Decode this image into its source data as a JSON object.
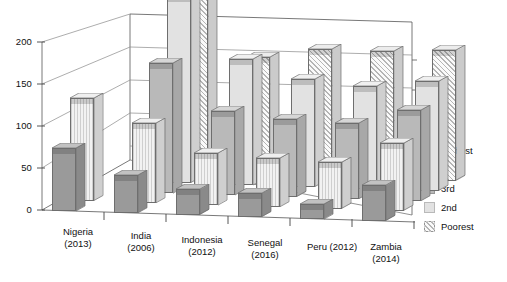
{
  "chart_data": {
    "type": "bar",
    "title": "",
    "xlabel": "",
    "ylabel": "",
    "ylim": [
      0,
      225
    ],
    "yticks": [
      0,
      50,
      100,
      150,
      200
    ],
    "grid": true,
    "threeD": true,
    "legend_position": "right",
    "categories": [
      "Nigeria\n(2013)",
      "India\n(2006)",
      "Indonesia\n(2012)",
      "Senegal\n(2016)",
      "Peru (2012)",
      "Zambia\n(2014)"
    ],
    "category_labels": [
      {
        "name": "Nigeria",
        "year": "(2013)"
      },
      {
        "name": "India",
        "year": "(2006)"
      },
      {
        "name": "Indonesia",
        "year": "(2012)"
      },
      {
        "name": "Senegal",
        "year": "(2016)"
      },
      {
        "name": "Peru (2012)",
        "year": ""
      },
      {
        "name": "Zambia",
        "year": "(2014)"
      }
    ],
    "series": [
      {
        "name": "Richest",
        "key": "richest",
        "color": "#9a9a9a",
        "pattern": "solid-dark",
        "values": [
          75,
          45,
          30,
          28,
          18,
          42
        ]
      },
      {
        "name": "4th",
        "key": "4th",
        "color": "#f2f2f2",
        "pattern": "vertical-lines",
        "values": [
          122,
          95,
          62,
          58,
          55,
          80
        ]
      },
      {
        "name": "3rd",
        "key": "3rd",
        "color": "#b9b9b9",
        "pattern": "solid-medium",
        "values": [
          null,
          155,
          100,
          92,
          90,
          108
        ]
      },
      {
        "name": "2nd",
        "key": "2nd",
        "color": "#e2e2e2",
        "pattern": "solid-light",
        "values": [
          null,
          222,
          150,
          128,
          122,
          130
        ]
      },
      {
        "name": "Poorest",
        "key": "poorest",
        "color": "#fafafa",
        "pattern": "diagonal-hatch",
        "values": [
          null,
          218,
          140,
          152,
          152,
          155
        ]
      }
    ],
    "legend": [
      "Richest",
      "4th",
      "3rd",
      "2nd",
      "Poorest"
    ]
  },
  "legend": {
    "items": [
      {
        "label": "Richest",
        "swatch": "f-richest"
      },
      {
        "label": "4th",
        "swatch": "f-4th"
      },
      {
        "label": "3rd",
        "swatch": "f-3rd"
      },
      {
        "label": "2nd",
        "swatch": "f-2nd"
      },
      {
        "label": "Poorest",
        "swatch": "f-poorest"
      }
    ]
  },
  "axis": {
    "yticks": [
      "200",
      "150",
      "100",
      "50",
      "0"
    ]
  }
}
